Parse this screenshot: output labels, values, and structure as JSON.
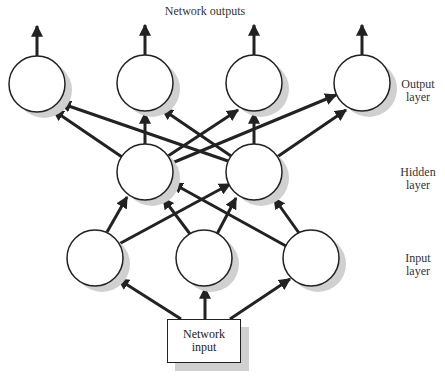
{
  "title": "Network outputs",
  "layers": {
    "output": {
      "label_line1": "Output",
      "label_line2": "layer"
    },
    "hidden": {
      "label_line1": "Hidden",
      "label_line2": "layer"
    },
    "input": {
      "label_line1": "Input",
      "label_line2": "layer"
    }
  },
  "input_box": {
    "line1": "Network",
    "line2": "input"
  },
  "nodes": {
    "output": [
      {
        "id": "O1",
        "cx": 37,
        "cy": 84
      },
      {
        "id": "O2",
        "cx": 145,
        "cy": 83
      },
      {
        "id": "O3",
        "cx": 254,
        "cy": 83
      },
      {
        "id": "O4",
        "cx": 362,
        "cy": 83
      }
    ],
    "hidden": [
      {
        "id": "H1",
        "cx": 145,
        "cy": 172
      },
      {
        "id": "H2",
        "cx": 254,
        "cy": 172
      }
    ],
    "input": [
      {
        "id": "I1",
        "cx": 95,
        "cy": 258
      },
      {
        "id": "I2",
        "cx": 204,
        "cy": 258
      },
      {
        "id": "I3",
        "cx": 311,
        "cy": 258
      }
    ]
  },
  "connections": {
    "input_to_input_nodes": [
      "box->I1",
      "box->I2",
      "box->I3"
    ],
    "input_to_hidden": [
      "I1->H1",
      "I1->H2",
      "I2->H1",
      "I2->H2",
      "I3->H1",
      "I3->H2"
    ],
    "hidden_to_output": [
      "H1->O1",
      "H1->O2",
      "H1->O3",
      "H1->O4",
      "H2->O1",
      "H2->O2",
      "H2->O3",
      "H2->O4"
    ],
    "outputs": [
      "O1->out",
      "O2->out",
      "O3->out",
      "O4->out"
    ]
  },
  "colors": {
    "stroke": "#222222",
    "shadow": "#d0d0d0",
    "fill": "#ffffff"
  }
}
